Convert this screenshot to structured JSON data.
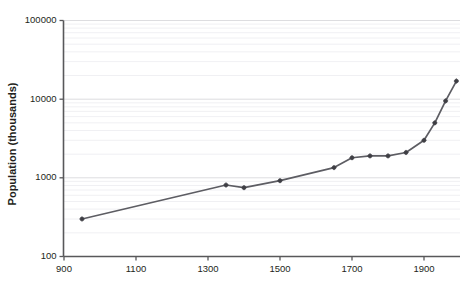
{
  "chart_data": {
    "type": "line",
    "title": "",
    "xlabel": "",
    "ylabel": "Population (thousands)",
    "xlim": [
      900,
      2000
    ],
    "ylim": [
      100,
      100000
    ],
    "yscale": "log",
    "grid": "horizontal-log-minor",
    "legend": "none",
    "xticks": [
      "900",
      "1100",
      "1300",
      "1500",
      "1700",
      "1900"
    ],
    "xtick_values": [
      900,
      1100,
      1300,
      1500,
      1700,
      1900
    ],
    "yticks": [
      "100",
      "1000",
      "10000",
      "100000"
    ],
    "ytick_values": [
      100,
      1000,
      10000,
      100000
    ],
    "series": [
      {
        "name": "Population",
        "x": [
          950,
          1350,
          1400,
          1500,
          1650,
          1700,
          1750,
          1800,
          1850,
          1900,
          1950,
          2000
        ],
        "values": [
          300,
          810,
          750,
          920,
          1350,
          1800,
          1900,
          1900,
          2100,
          3000,
          5000,
          9500
        ]
      }
    ],
    "points": [
      {
        "year": 950,
        "population": 300
      },
      {
        "year": 1350,
        "population": 810
      },
      {
        "year": 1400,
        "population": 750
      },
      {
        "year": 1500,
        "population": 920
      },
      {
        "year": 1650,
        "population": 1350
      },
      {
        "year": 1700,
        "population": 1800
      },
      {
        "year": 1750,
        "population": 1900
      },
      {
        "year": 1800,
        "population": 1900
      },
      {
        "year": 1850,
        "population": 2100
      },
      {
        "year": 1900,
        "population": 3000
      },
      {
        "year": 1930,
        "population": 5000
      },
      {
        "year": 1960,
        "population": 9500
      },
      {
        "year": 1990,
        "population": 17000
      }
    ],
    "colors": {
      "line": "#5d5d63",
      "marker": "#3f3f45",
      "axis": "#58585a",
      "grid_major": "#d9d9dd",
      "grid_minor": "#ececf0",
      "text": "#231f20",
      "background": "#ffffff"
    }
  }
}
